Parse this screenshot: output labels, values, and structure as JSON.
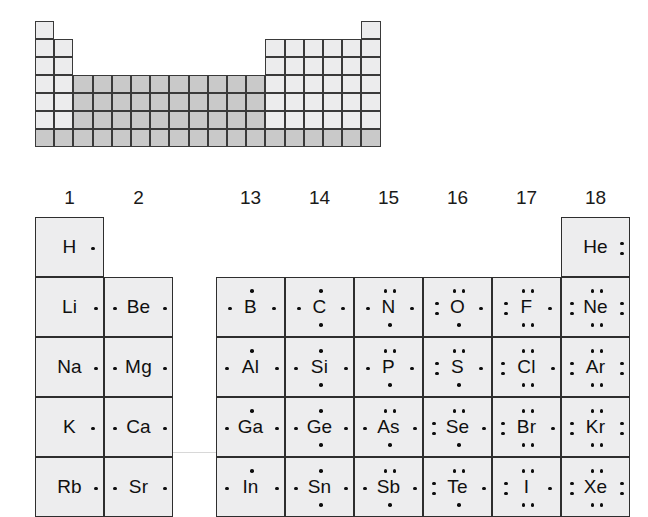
{
  "figure": {
    "schematic": {
      "name": "periodic-table-schematic",
      "description": "Outline of the periodic table with the d-block and bottom period shaded",
      "rows": 7,
      "cols": 18,
      "cell_w": 19.2,
      "cell_h": 18,
      "layout": [
        {
          "row": 0,
          "cols": [
            1,
            18
          ]
        },
        {
          "row": 1,
          "cols": [
            1,
            2,
            13,
            14,
            15,
            16,
            17,
            18
          ]
        },
        {
          "row": 2,
          "cols": [
            1,
            2,
            13,
            14,
            15,
            16,
            17,
            18
          ]
        },
        {
          "row": 3,
          "cols": [
            1,
            2,
            3,
            4,
            5,
            6,
            7,
            8,
            9,
            10,
            11,
            12,
            13,
            14,
            15,
            16,
            17,
            18
          ]
        },
        {
          "row": 4,
          "cols": [
            1,
            2,
            3,
            4,
            5,
            6,
            7,
            8,
            9,
            10,
            11,
            12,
            13,
            14,
            15,
            16,
            17,
            18
          ]
        },
        {
          "row": 5,
          "cols": [
            1,
            2,
            3,
            4,
            5,
            6,
            7,
            8,
            9,
            10,
            11,
            12,
            13,
            14,
            15,
            16,
            17,
            18
          ]
        },
        {
          "row": 6,
          "cols": [
            1,
            2,
            3,
            4,
            5,
            6,
            7,
            8,
            9,
            10,
            11,
            12,
            13,
            14,
            15,
            16,
            17,
            18
          ]
        }
      ],
      "shaded_cols": [
        3,
        4,
        5,
        6,
        7,
        8,
        9,
        10,
        11,
        12
      ],
      "shaded_rows": [
        6
      ],
      "colors": {
        "border": "#3a3a3a",
        "fill_light": "#ececed",
        "fill_shaded": "#c9c9c9"
      }
    },
    "group_headers": [
      "1",
      "2",
      "13",
      "14",
      "15",
      "16",
      "17",
      "18"
    ],
    "colors": {
      "cell_border": "#2e2e2e",
      "cell_fill": "#ededee",
      "dot": "#0d0d0d",
      "text": "#101010"
    },
    "elements": [
      {
        "symbol": "H",
        "group": 1,
        "period": 1,
        "valence": 1,
        "dots": {
          "top": 0,
          "right": 1,
          "bottom": 0,
          "left": 0
        }
      },
      {
        "symbol": "He",
        "group": 18,
        "period": 1,
        "valence": 2,
        "dots": {
          "top": 0,
          "right": 2,
          "bottom": 0,
          "left": 0
        }
      },
      {
        "symbol": "Li",
        "group": 1,
        "period": 2,
        "valence": 1,
        "dots": {
          "top": 0,
          "right": 1,
          "bottom": 0,
          "left": 0
        }
      },
      {
        "symbol": "Be",
        "group": 2,
        "period": 2,
        "valence": 2,
        "dots": {
          "top": 0,
          "right": 1,
          "bottom": 0,
          "left": 1
        }
      },
      {
        "symbol": "B",
        "group": 13,
        "period": 2,
        "valence": 3,
        "dots": {
          "top": 1,
          "right": 1,
          "bottom": 0,
          "left": 1
        }
      },
      {
        "symbol": "C",
        "group": 14,
        "period": 2,
        "valence": 4,
        "dots": {
          "top": 1,
          "right": 1,
          "bottom": 1,
          "left": 1
        }
      },
      {
        "symbol": "N",
        "group": 15,
        "period": 2,
        "valence": 5,
        "dots": {
          "top": 2,
          "right": 1,
          "bottom": 1,
          "left": 1
        }
      },
      {
        "symbol": "O",
        "group": 16,
        "period": 2,
        "valence": 6,
        "dots": {
          "top": 2,
          "right": 1,
          "bottom": 1,
          "left": 2
        }
      },
      {
        "symbol": "F",
        "group": 17,
        "period": 2,
        "valence": 7,
        "dots": {
          "top": 2,
          "right": 1,
          "bottom": 2,
          "left": 2
        }
      },
      {
        "symbol": "Ne",
        "group": 18,
        "period": 2,
        "valence": 8,
        "dots": {
          "top": 2,
          "right": 2,
          "bottom": 2,
          "left": 2
        }
      },
      {
        "symbol": "Na",
        "group": 1,
        "period": 3,
        "valence": 1,
        "dots": {
          "top": 0,
          "right": 1,
          "bottom": 0,
          "left": 0
        }
      },
      {
        "symbol": "Mg",
        "group": 2,
        "period": 3,
        "valence": 2,
        "dots": {
          "top": 0,
          "right": 1,
          "bottom": 0,
          "left": 1
        }
      },
      {
        "symbol": "Al",
        "group": 13,
        "period": 3,
        "valence": 3,
        "dots": {
          "top": 1,
          "right": 1,
          "bottom": 0,
          "left": 1
        }
      },
      {
        "symbol": "Si",
        "group": 14,
        "period": 3,
        "valence": 4,
        "dots": {
          "top": 1,
          "right": 1,
          "bottom": 1,
          "left": 1
        }
      },
      {
        "symbol": "P",
        "group": 15,
        "period": 3,
        "valence": 5,
        "dots": {
          "top": 2,
          "right": 1,
          "bottom": 1,
          "left": 1
        }
      },
      {
        "symbol": "S",
        "group": 16,
        "period": 3,
        "valence": 6,
        "dots": {
          "top": 2,
          "right": 1,
          "bottom": 1,
          "left": 2
        }
      },
      {
        "symbol": "Cl",
        "group": 17,
        "period": 3,
        "valence": 7,
        "dots": {
          "top": 2,
          "right": 1,
          "bottom": 2,
          "left": 2
        }
      },
      {
        "symbol": "Ar",
        "group": 18,
        "period": 3,
        "valence": 8,
        "dots": {
          "top": 2,
          "right": 2,
          "bottom": 2,
          "left": 2
        }
      },
      {
        "symbol": "K",
        "group": 1,
        "period": 4,
        "valence": 1,
        "dots": {
          "top": 0,
          "right": 1,
          "bottom": 0,
          "left": 0
        }
      },
      {
        "symbol": "Ca",
        "group": 2,
        "period": 4,
        "valence": 2,
        "dots": {
          "top": 0,
          "right": 1,
          "bottom": 0,
          "left": 1
        }
      },
      {
        "symbol": "Ga",
        "group": 13,
        "period": 4,
        "valence": 3,
        "dots": {
          "top": 1,
          "right": 1,
          "bottom": 0,
          "left": 1
        }
      },
      {
        "symbol": "Ge",
        "group": 14,
        "period": 4,
        "valence": 4,
        "dots": {
          "top": 1,
          "right": 1,
          "bottom": 1,
          "left": 1
        }
      },
      {
        "symbol": "As",
        "group": 15,
        "period": 4,
        "valence": 5,
        "dots": {
          "top": 2,
          "right": 1,
          "bottom": 1,
          "left": 1
        }
      },
      {
        "symbol": "Se",
        "group": 16,
        "period": 4,
        "valence": 6,
        "dots": {
          "top": 2,
          "right": 1,
          "bottom": 1,
          "left": 2
        }
      },
      {
        "symbol": "Br",
        "group": 17,
        "period": 4,
        "valence": 7,
        "dots": {
          "top": 2,
          "right": 1,
          "bottom": 2,
          "left": 2
        }
      },
      {
        "symbol": "Kr",
        "group": 18,
        "period": 4,
        "valence": 8,
        "dots": {
          "top": 2,
          "right": 2,
          "bottom": 2,
          "left": 2
        }
      },
      {
        "symbol": "Rb",
        "group": 1,
        "period": 5,
        "valence": 1,
        "dots": {
          "top": 0,
          "right": 1,
          "bottom": 0,
          "left": 0
        }
      },
      {
        "symbol": "Sr",
        "group": 2,
        "period": 5,
        "valence": 2,
        "dots": {
          "top": 0,
          "right": 1,
          "bottom": 0,
          "left": 1
        }
      },
      {
        "symbol": "In",
        "group": 13,
        "period": 5,
        "valence": 3,
        "dots": {
          "top": 1,
          "right": 1,
          "bottom": 0,
          "left": 1
        }
      },
      {
        "symbol": "Sn",
        "group": 14,
        "period": 5,
        "valence": 4,
        "dots": {
          "top": 1,
          "right": 1,
          "bottom": 1,
          "left": 1
        }
      },
      {
        "symbol": "Sb",
        "group": 15,
        "period": 5,
        "valence": 5,
        "dots": {
          "top": 2,
          "right": 1,
          "bottom": 1,
          "left": 1
        }
      },
      {
        "symbol": "Te",
        "group": 16,
        "period": 5,
        "valence": 6,
        "dots": {
          "top": 2,
          "right": 1,
          "bottom": 1,
          "left": 2
        }
      },
      {
        "symbol": "I",
        "group": 17,
        "period": 5,
        "valence": 7,
        "dots": {
          "top": 2,
          "right": 1,
          "bottom": 2,
          "left": 2
        }
      },
      {
        "symbol": "Xe",
        "group": 18,
        "period": 5,
        "valence": 8,
        "dots": {
          "top": 2,
          "right": 2,
          "bottom": 2,
          "left": 2
        }
      }
    ],
    "geometry": {
      "cell_w": 69,
      "cell_h": 60,
      "s_block_left": 35,
      "p_block_left": 216,
      "grid_top": 217,
      "group_x": {
        "1": 35,
        "2": 104,
        "13": 216,
        "14": 285,
        "15": 354,
        "16": 423,
        "17": 492,
        "18": 561
      }
    }
  }
}
